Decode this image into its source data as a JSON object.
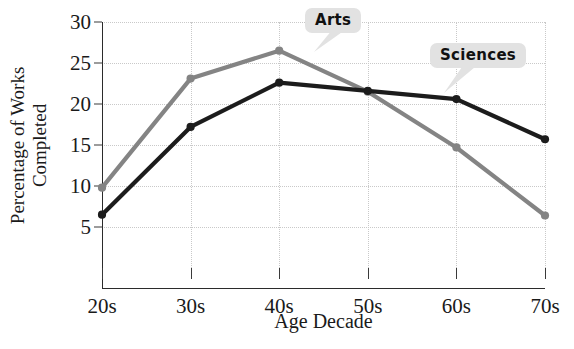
{
  "chart_data": {
    "type": "line",
    "title": "",
    "xlabel": "Age Decade",
    "ylabel_lines": [
      "Percentage of Works",
      "Completed"
    ],
    "ylabel": "Percentage of Works Completed",
    "categories": [
      "20s",
      "30s",
      "40s",
      "50s",
      "60s",
      "70s"
    ],
    "yticks": [
      5,
      10,
      15,
      20,
      25,
      30
    ],
    "ytick_labels": [
      "5",
      "10",
      "15",
      "20",
      "25",
      "30"
    ],
    "ylim": [
      0,
      30
    ],
    "grid": "both-dotted",
    "legend_position": "inline-callouts",
    "series": [
      {
        "name": "Arts",
        "color": "#848484",
        "marker": "circle",
        "values": [
          9.8,
          23.1,
          26.5,
          21.5,
          14.7,
          6.4
        ]
      },
      {
        "name": "Sciences",
        "color": "#1c1c1c",
        "marker": "circle",
        "values": [
          6.5,
          17.2,
          22.6,
          21.6,
          20.6,
          15.7
        ]
      }
    ],
    "annotations": [
      {
        "text": "Arts",
        "points_to_series": "Arts",
        "points_to_category": "40s"
      },
      {
        "text": "Sciences",
        "points_to_series": "Sciences",
        "points_to_category": "60s"
      }
    ]
  },
  "style": {
    "background": "#ffffff",
    "axis_color": "#2b2b2b",
    "grid_color": "#c9c9c9",
    "callout_bg": "#e2e2e2",
    "text_color": "#1a1a1a"
  }
}
